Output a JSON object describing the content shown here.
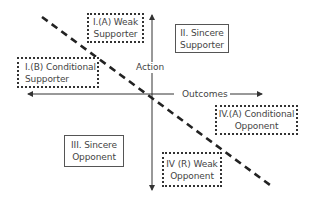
{
  "diagram": {
    "axes": {
      "vertical": {
        "label": "Action"
      },
      "horizontal": {
        "label": "Outcomes"
      }
    },
    "quadrants": [
      {
        "id": "IA",
        "line1": "I.(A) Weak",
        "line2": "Supporter",
        "border": "dotted"
      },
      {
        "id": "II",
        "line1": "II. Sincere",
        "line2": "Supporter",
        "border": "solid"
      },
      {
        "id": "IB",
        "line1": "I.(B) Conditional",
        "line2": "Supporter",
        "border": "dotted"
      },
      {
        "id": "III",
        "line1": "III. Sincere",
        "line2": "Opponent",
        "border": "solid"
      },
      {
        "id": "IVA",
        "line1": "IV.(A) Conditional",
        "line2": "Opponent",
        "border": "dotted"
      },
      {
        "id": "IVR",
        "line1": "IV (R) Weak",
        "line2": "Opponent",
        "border": "dotted"
      }
    ],
    "colors": {
      "line": "#222222",
      "axis": "#333333",
      "text": "#444444",
      "background": "#ffffff"
    }
  }
}
